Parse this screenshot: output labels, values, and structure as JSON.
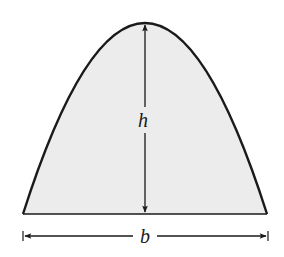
{
  "diagram": {
    "shape": "parabolic-segment",
    "fill_color": "#ececec",
    "stroke_color": "#1a1a1a",
    "labels": {
      "height": "h",
      "base": "b"
    }
  }
}
